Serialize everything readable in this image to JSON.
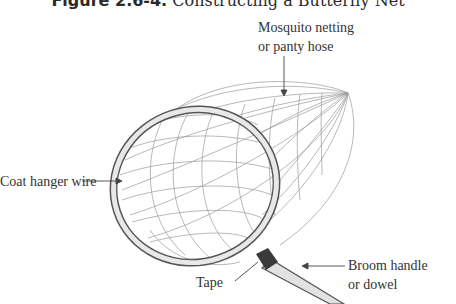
{
  "figure": {
    "title_bold": "Figure 2.6-4.",
    "title_text": "Constructing a Butterfly Net"
  },
  "labels": {
    "netting_line1": "Mosquito netting",
    "netting_line2": "or panty hose",
    "wire": "Coat hanger wire",
    "tape": "Tape",
    "handle_line1": "Broom handle",
    "handle_line2": "or dowel"
  },
  "colors": {
    "line": "#555555",
    "mesh": "#8a8a8a",
    "tape": "#3a3a3a",
    "handle_fill": "#e2e2e2"
  }
}
